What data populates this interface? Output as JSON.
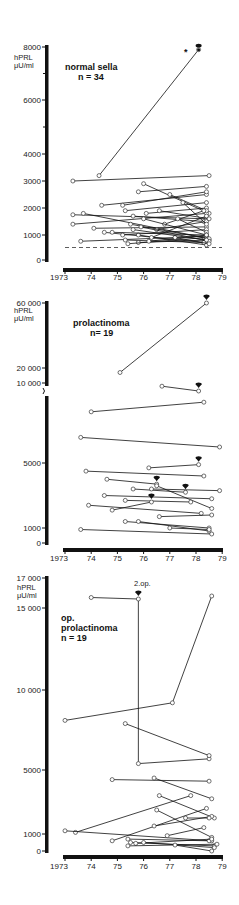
{
  "chart_data": [
    {
      "type": "line",
      "title": "normal sella",
      "subtitle": "n = 34",
      "ylabel": "hPRL μU/ml",
      "xlabel": "",
      "yticks": [
        0,
        1000,
        2000,
        3000,
        4000,
        6000,
        8000
      ],
      "ytick_labels": [
        "0",
        "1000",
        "2000",
        "3000",
        "4000",
        "6000",
        "8000"
      ],
      "xticks": [
        "1973",
        "74",
        "75",
        "76",
        "77",
        "78",
        "79"
      ],
      "ylim": [
        0,
        8000
      ],
      "reference_line": {
        "style": "dashed",
        "y": 500
      },
      "annotations": [
        {
          "text": "*",
          "x": 1978.5,
          "y": 7900
        },
        {
          "text": "surgery marker",
          "x": 1978.1,
          "y": 8100
        }
      ],
      "series": [
        {
          "x": [
            1974.3,
            1978.1
          ],
          "y": [
            3200,
            7900
          ]
        },
        {
          "x": [
            1973.3,
            1978.5
          ],
          "y": [
            3000,
            3200
          ]
        },
        {
          "x": [
            1976.0,
            1978.5
          ],
          "y": [
            2900,
            1800
          ]
        },
        {
          "x": [
            1975.8,
            1978.4
          ],
          "y": [
            2600,
            2800
          ]
        },
        {
          "x": [
            1974.4,
            1978.4
          ],
          "y": [
            2100,
            2500
          ]
        },
        {
          "x": [
            1975.2,
            1978.4
          ],
          "y": [
            2100,
            2600
          ]
        },
        {
          "x": [
            1973.3,
            1978.4
          ],
          "y": [
            1750,
            1600
          ]
        },
        {
          "x": [
            1973.7,
            1978.3
          ],
          "y": [
            1800,
            900
          ]
        },
        {
          "x": [
            1975.3,
            1978.4
          ],
          "y": [
            1900,
            2200
          ]
        },
        {
          "x": [
            1975.6,
            1978.3
          ],
          "y": [
            1700,
            1500
          ]
        },
        {
          "x": [
            1976.1,
            1978.4
          ],
          "y": [
            1800,
            2000
          ]
        },
        {
          "x": [
            1973.3,
            1978.4
          ],
          "y": [
            1400,
            1800
          ]
        },
        {
          "x": [
            1974.1,
            1978.4
          ],
          "y": [
            1250,
            1300
          ]
        },
        {
          "x": [
            1974.5,
            1978.3
          ],
          "y": [
            1100,
            700
          ]
        },
        {
          "x": [
            1975.2,
            1978.4
          ],
          "y": [
            1000,
            1200
          ]
        },
        {
          "x": [
            1975.8,
            1978.4
          ],
          "y": [
            1000,
            600
          ]
        },
        {
          "x": [
            1976.5,
            1978.4
          ],
          "y": [
            1200,
            1500
          ]
        },
        {
          "x": [
            1973.6,
            1978.4
          ],
          "y": [
            750,
            950
          ]
        },
        {
          "x": [
            1975.3,
            1978.3
          ],
          "y": [
            800,
            700
          ]
        },
        {
          "x": [
            1975.8,
            1978.5
          ],
          "y": [
            700,
            800
          ]
        },
        {
          "x": [
            1976.3,
            1978.4
          ],
          "y": [
            900,
            1700
          ]
        },
        {
          "x": [
            1975.4,
            1978.4
          ],
          "y": [
            650,
            900
          ]
        },
        {
          "x": [
            1977.0,
            1978.4
          ],
          "y": [
            2500,
            1900
          ]
        },
        {
          "x": [
            1976.8,
            1978.3
          ],
          "y": [
            1400,
            1900
          ]
        },
        {
          "x": [
            1977.3,
            1978.4
          ],
          "y": [
            1600,
            1100
          ]
        },
        {
          "x": [
            1976.0,
            1978.4
          ],
          "y": [
            1600,
            1000
          ]
        },
        {
          "x": [
            1975.5,
            1978.5
          ],
          "y": [
            1400,
            850
          ]
        },
        {
          "x": [
            1977.5,
            1978.4
          ],
          "y": [
            2200,
            1400
          ]
        },
        {
          "x": [
            1976.6,
            1978.5
          ],
          "y": [
            1900,
            1600
          ]
        },
        {
          "x": [
            1975.9,
            1978.5
          ],
          "y": [
            1300,
            750
          ]
        },
        {
          "x": [
            1976.2,
            1978.4
          ],
          "y": [
            750,
            1000
          ]
        },
        {
          "x": [
            1977.2,
            1978.5
          ],
          "y": [
            900,
            650
          ]
        },
        {
          "x": [
            1974.8,
            1978.4
          ],
          "y": [
            1100,
            1000
          ]
        },
        {
          "x": [
            1975.6,
            1978.4
          ],
          "y": [
            1200,
            800
          ]
        }
      ]
    },
    {
      "type": "line",
      "title": "prolactinoma",
      "subtitle": "n = 19",
      "ylabel": "hPRL μU/ml",
      "xlabel": "",
      "yticks": [
        0,
        1000,
        5000,
        10000,
        20000,
        60000
      ],
      "ytick_labels": [
        "0",
        "1000",
        "5000",
        "10000",
        "20000",
        "60000"
      ],
      "xticks": [
        "1973",
        "74",
        "75",
        "76",
        "77",
        "78",
        "79"
      ],
      "axis_break": true,
      "ylim": [
        0,
        60000
      ],
      "series": [
        {
          "x": [
            1975.1,
            1978.4
          ],
          "y": [
            17000,
            60000
          ],
          "surgery_end": true
        },
        {
          "x": [
            1976.7,
            1978.1
          ],
          "y": [
            9800,
            9500
          ],
          "surgery_end": true
        },
        {
          "x": [
            1974.0,
            1978.3
          ],
          "y": [
            8200,
            8800
          ]
        },
        {
          "x": [
            1973.6,
            1978.9
          ],
          "y": [
            6600,
            6000
          ]
        },
        {
          "x": [
            1976.2,
            1978.1
          ],
          "y": [
            4700,
            4900
          ],
          "surgery_end": true
        },
        {
          "x": [
            1973.8,
            1978.3
          ],
          "y": [
            4500,
            4200
          ]
        },
        {
          "x": [
            1974.6,
            1976.5
          ],
          "y": [
            4000,
            3700
          ],
          "surgery_end": true
        },
        {
          "x": [
            1976.5,
            1978.6
          ],
          "y": [
            3600,
            2200
          ]
        },
        {
          "x": [
            1975.6,
            1977.6
          ],
          "y": [
            3400,
            3200
          ],
          "surgery_end": true
        },
        {
          "x": [
            1976.3,
            1978.9
          ],
          "y": [
            3400,
            3300
          ]
        },
        {
          "x": [
            1974.5,
            1978.6
          ],
          "y": [
            3000,
            2800
          ]
        },
        {
          "x": [
            1975.3,
            1977.8
          ],
          "y": [
            2700,
            2600
          ]
        },
        {
          "x": [
            1974.8,
            1976.3
          ],
          "y": [
            2100,
            2600
          ],
          "surgery_end": true
        },
        {
          "x": [
            1973.9,
            1978.2
          ],
          "y": [
            2400,
            1900
          ]
        },
        {
          "x": [
            1976.6,
            1978.6
          ],
          "y": [
            1700,
            1800
          ]
        },
        {
          "x": [
            1975.3,
            1978.5
          ],
          "y": [
            1400,
            1000
          ]
        },
        {
          "x": [
            1975.8,
            1978.5
          ],
          "y": [
            1400,
            800
          ]
        },
        {
          "x": [
            1977.0,
            1978.5
          ],
          "y": [
            1000,
            900
          ]
        },
        {
          "x": [
            1973.6,
            1978.6
          ],
          "y": [
            900,
            600
          ]
        }
      ]
    },
    {
      "type": "line",
      "title": "op. prolactinoma",
      "subtitle": "n = 19",
      "ylabel": "hPRL μU/ml",
      "xlabel": "",
      "yticks": [
        0,
        1000,
        5000,
        10000,
        15000,
        17000
      ],
      "ytick_labels": [
        "0",
        "1000",
        "5000",
        "10000",
        "15000",
        "17000"
      ],
      "xticks": [
        "1973",
        "74",
        "75",
        "76",
        "77",
        "78",
        "79"
      ],
      "ylim": [
        0,
        17000
      ],
      "annotations": [
        {
          "text": "2.op.",
          "x": 1975.8,
          "y": 16500
        }
      ],
      "series": [
        {
          "x": [
            1974.0,
            1975.8,
            1975.8,
            1978.5
          ],
          "y": [
            15700,
            15600,
            5400,
            5700
          ],
          "surgery_at": 1
        },
        {
          "x": [
            1973.0,
            1977.1,
            1978.6
          ],
          "y": [
            8100,
            9200,
            15800
          ]
        },
        {
          "x": [
            1975.3,
            1978.5
          ],
          "y": [
            7900,
            5900
          ]
        },
        {
          "x": [
            1974.8,
            1978.5
          ],
          "y": [
            4400,
            4300
          ]
        },
        {
          "x": [
            1976.4,
            1978.6
          ],
          "y": [
            4500,
            3200
          ]
        },
        {
          "x": [
            1973.4,
            1977.8
          ],
          "y": [
            1100,
            3400
          ]
        },
        {
          "x": [
            1976.6,
            1978.7
          ],
          "y": [
            3400,
            2000
          ]
        },
        {
          "x": [
            1973.0,
            1978.6
          ],
          "y": [
            1200,
            600
          ]
        },
        {
          "x": [
            1974.8,
            1978.4
          ],
          "y": [
            600,
            2600
          ]
        },
        {
          "x": [
            1976.4,
            1978.6
          ],
          "y": [
            1500,
            2100
          ]
        },
        {
          "x": [
            1976.5,
            1978.6
          ],
          "y": [
            2500,
            800
          ]
        },
        {
          "x": [
            1977.6,
            1978.5
          ],
          "y": [
            2000,
            2000
          ]
        },
        {
          "x": [
            1976.9,
            1978.3
          ],
          "y": [
            900,
            1400
          ]
        },
        {
          "x": [
            1975.4,
            1978.5
          ],
          "y": [
            700,
            600
          ]
        },
        {
          "x": [
            1975.5,
            1978.7
          ],
          "y": [
            500,
            300
          ]
        },
        {
          "x": [
            1975.7,
            1978.6
          ],
          "y": [
            450,
            700
          ]
        },
        {
          "x": [
            1975.4,
            1978.8
          ],
          "y": [
            300,
            400
          ]
        },
        {
          "x": [
            1976.0,
            1978.7
          ],
          "y": [
            500,
            200
          ]
        },
        {
          "x": [
            1977.2,
            1978.6
          ],
          "y": [
            350,
            0
          ]
        }
      ]
    }
  ],
  "panels": [
    {
      "title_line1": "normal sella",
      "title_line2": "n = 34",
      "unit_line1": "hPRL",
      "unit_line2": "μU/ml",
      "asterisk": "*"
    },
    {
      "title_line1": "prolactinoma",
      "title_line2": "n= 19",
      "unit_line1": "hPRL",
      "unit_line2": "μU/ml"
    },
    {
      "title_line1": "op.",
      "title_line2": "prolactinoma",
      "title_line3": "n = 19",
      "unit_line1": "hPRL",
      "unit_line2": "μU/ml",
      "annotation": "2.op."
    }
  ]
}
